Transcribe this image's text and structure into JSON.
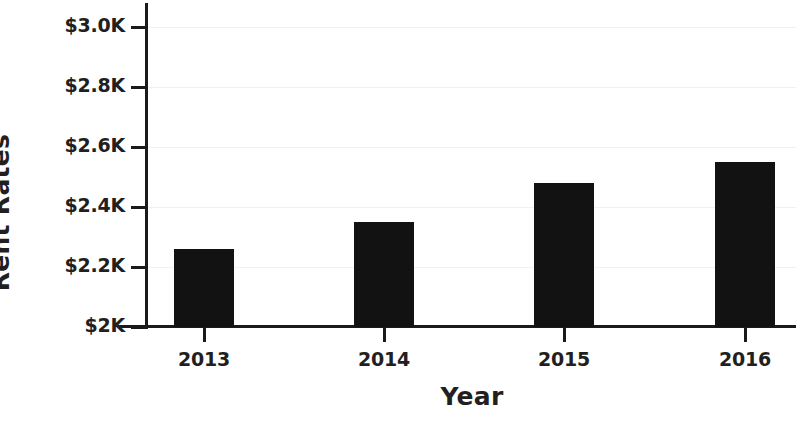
{
  "chart_data": {
    "type": "bar",
    "title": "",
    "xlabel": "Year",
    "ylabel": "Rent Rates",
    "categories": [
      "2013",
      "2014",
      "2015",
      "2016"
    ],
    "values": [
      2260,
      2350,
      2480,
      2550
    ],
    "value_labels": [
      "$2.26K",
      "$2.35K",
      "$2.48K",
      "$2.55K"
    ],
    "ylim": [
      2000,
      3050
    ],
    "y_ticks": [
      2000,
      2200,
      2400,
      2600,
      2800,
      3000
    ],
    "y_tick_labels": [
      "$2K",
      "$2.2K",
      "$2.4K",
      "$2.6K",
      "$2.8K",
      "$3.0K"
    ],
    "grid": true,
    "legend": null,
    "series": [
      {
        "name": "Rent Rates",
        "values": [
          2260,
          2350,
          2480,
          2550
        ],
        "color": "#121212"
      }
    ],
    "colors": {
      "bar": "#121212",
      "axis": "#1a1a1a",
      "gridline": "#f1f1f1",
      "text": "#231f20",
      "background": "#ffffff"
    }
  },
  "axes": {
    "y_title": "Rent Rates",
    "x_title": "Year",
    "y_tick_labels": [
      {
        "text": "$3.0K",
        "y": 27
      },
      {
        "text": "$2.8K",
        "y": 87
      },
      {
        "text": "$2.6K",
        "y": 147
      },
      {
        "text": "$2.4K",
        "y": 207
      },
      {
        "text": "$2.2K",
        "y": 267
      },
      {
        "text": "$2K",
        "y": 327
      }
    ],
    "x_tick_labels": [
      {
        "text": "2013",
        "x": 204
      },
      {
        "text": "2014",
        "x": 384
      },
      {
        "text": "2015",
        "x": 564
      },
      {
        "text": "2016",
        "x": 745
      }
    ]
  },
  "bars": [
    {
      "label": "2013",
      "value": 2260,
      "left": 174,
      "top": 249,
      "height": 78
    },
    {
      "label": "2014",
      "value": 2350,
      "left": 354,
      "top": 222,
      "height": 105
    },
    {
      "label": "2015",
      "value": 2480,
      "left": 534,
      "top": 183,
      "height": 144
    },
    {
      "label": "2016",
      "value": 2550,
      "left": 715,
      "top": 162,
      "height": 165
    }
  ],
  "gridlines": [
    27,
    87,
    147,
    207,
    267
  ]
}
